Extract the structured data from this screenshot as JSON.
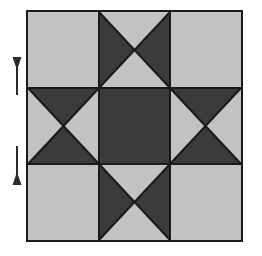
{
  "figure": {
    "title": "Quilt block diagram",
    "description": "Ohio Star quilt block: three by three grid of square units with plain light corner squares, quarter-square-triangle hourglass units on the four side positions, and a solid dark center square.",
    "canvas": {
      "width": 262,
      "height": 256
    },
    "background_color": "#ffffff"
  },
  "colors": {
    "light_fabric": "#c2c2c2",
    "dark_fabric": "#3b3b3b",
    "seam_line": "#1a1a1a",
    "block_border": "#1a1a1a",
    "arrow": "#2b2b2b",
    "background": "#ffffff"
  },
  "block": {
    "name": "ohio-star-block",
    "x": 26,
    "y": 10,
    "width": 217,
    "height": 232,
    "rows": 3,
    "columns": 3,
    "border_width": 2,
    "seam_width": 2,
    "cells": [
      {
        "id": "cell-top-left",
        "row": 0,
        "col": 0,
        "unit": "plain-square",
        "fill": "light",
        "triangles": []
      },
      {
        "id": "cell-top-center",
        "row": 0,
        "col": 1,
        "unit": "hourglass-horizontal",
        "fill": "mixed",
        "triangles": [
          {
            "position": "top",
            "fill": "light"
          },
          {
            "position": "right",
            "fill": "dark"
          },
          {
            "position": "bottom",
            "fill": "light"
          },
          {
            "position": "left",
            "fill": "dark"
          }
        ]
      },
      {
        "id": "cell-top-right",
        "row": 0,
        "col": 2,
        "unit": "plain-square",
        "fill": "light",
        "triangles": []
      },
      {
        "id": "cell-middle-left",
        "row": 1,
        "col": 0,
        "unit": "hourglass-vertical",
        "fill": "mixed",
        "triangles": [
          {
            "position": "top",
            "fill": "dark"
          },
          {
            "position": "right",
            "fill": "light"
          },
          {
            "position": "bottom",
            "fill": "dark"
          },
          {
            "position": "left",
            "fill": "light"
          }
        ]
      },
      {
        "id": "cell-center",
        "row": 1,
        "col": 1,
        "unit": "plain-square",
        "fill": "dark",
        "triangles": []
      },
      {
        "id": "cell-middle-right",
        "row": 1,
        "col": 2,
        "unit": "hourglass-vertical",
        "fill": "mixed",
        "triangles": [
          {
            "position": "top",
            "fill": "dark"
          },
          {
            "position": "right",
            "fill": "light"
          },
          {
            "position": "bottom",
            "fill": "dark"
          },
          {
            "position": "left",
            "fill": "light"
          }
        ]
      },
      {
        "id": "cell-bottom-left",
        "row": 2,
        "col": 0,
        "unit": "plain-square",
        "fill": "light",
        "triangles": []
      },
      {
        "id": "cell-bottom-center",
        "row": 2,
        "col": 1,
        "unit": "hourglass-horizontal",
        "fill": "mixed",
        "triangles": [
          {
            "position": "top",
            "fill": "light"
          },
          {
            "position": "right",
            "fill": "dark"
          },
          {
            "position": "bottom",
            "fill": "light"
          },
          {
            "position": "left",
            "fill": "dark"
          }
        ]
      },
      {
        "id": "cell-bottom-right",
        "row": 2,
        "col": 2,
        "unit": "plain-square",
        "fill": "light",
        "triangles": []
      }
    ]
  },
  "annotations": {
    "arrows": [
      {
        "id": "arrow-upper",
        "direction": "up",
        "label": "",
        "tail_x": 17,
        "tail_y": 95,
        "head_x": 17,
        "head_y": 70,
        "points_to_row_seam": "row-1-top"
      },
      {
        "id": "arrow-lower",
        "direction": "down",
        "label": "",
        "tail_x": 17,
        "tail_y": 146,
        "head_x": 17,
        "head_y": 172,
        "points_to_row_seam": "row-1-bottom"
      }
    ]
  }
}
